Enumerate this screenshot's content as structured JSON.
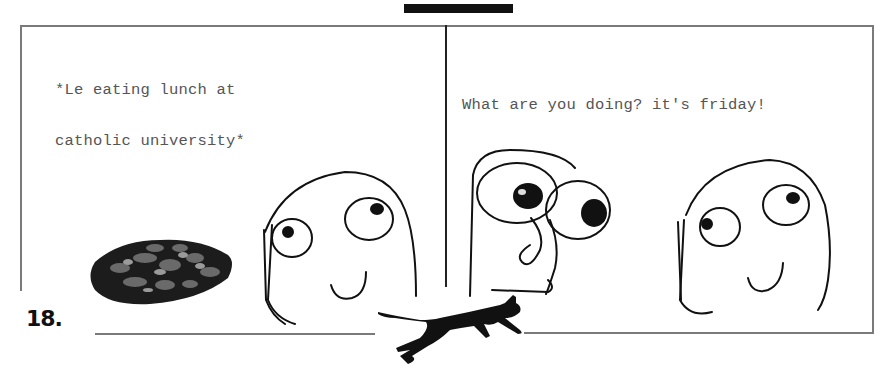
{
  "comic": {
    "number_label": "18.",
    "panels": [
      {
        "caption_lines": [
          "*Le eating lunch at",
          "catholic university*"
        ],
        "characters": [
          "derp-face"
        ],
        "objects": [
          "meat-tray"
        ]
      },
      {
        "caption_lines": [
          "What are you doing? it's friday!"
        ],
        "characters": [
          "shocked-face",
          "derp-face"
        ]
      }
    ],
    "decorations": [
      "top-black-bar",
      "running-black-cat"
    ]
  },
  "colors": {
    "frame": "#7a7a7a",
    "divider": "#222222",
    "ink": "#111111",
    "text": "#555555",
    "background": "#ffffff"
  }
}
